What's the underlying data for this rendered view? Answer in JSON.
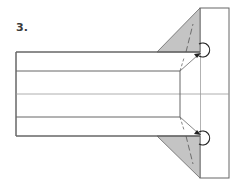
{
  "diagram": {
    "step_label": "3.",
    "type": "origami-fold-step",
    "colors": {
      "paper": "#ffffff",
      "shaded_flap": "#c4c4c4",
      "line": "#555555",
      "crease": "#9a9a9a"
    },
    "elements": [
      "main-rectangle",
      "top-strip",
      "center-crease",
      "bottom-strip",
      "right-panel",
      "top-shaded-triangle",
      "bottom-shaded-triangle",
      "top-fold-arrow",
      "bottom-fold-arrow"
    ]
  }
}
